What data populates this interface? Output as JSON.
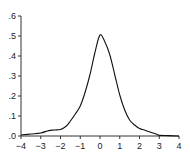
{
  "chart_data": {
    "type": "line",
    "title": "",
    "xlabel": "",
    "ylabel": "",
    "xlim": [
      -4,
      4
    ],
    "ylim": [
      0,
      0.6
    ],
    "grid": false,
    "legend": null,
    "x_ticks": [
      -4,
      -3,
      -2,
      -1,
      0,
      1,
      2,
      3,
      4
    ],
    "x_tick_labels": [
      "−4",
      "−3",
      "−2",
      "−1",
      "0",
      "1",
      "2",
      "3",
      "4"
    ],
    "y_ticks": [
      0,
      0.1,
      0.2,
      0.3,
      0.4,
      0.5,
      0.6
    ],
    "y_tick_labels": [
      ".0",
      ".1",
      ".2",
      ".3",
      ".4",
      ".5",
      ".6"
    ],
    "series": [
      {
        "name": "density",
        "color": "#111111",
        "x": [
          -4.0,
          -3.5,
          -3.0,
          -2.6,
          -2.3,
          -2.0,
          -1.7,
          -1.5,
          -1.25,
          -1.0,
          -0.75,
          -0.5,
          -0.25,
          0.0,
          0.25,
          0.5,
          0.75,
          1.0,
          1.25,
          1.5,
          1.75,
          2.0,
          2.3,
          2.6,
          2.9,
          3.0,
          3.5,
          4.0
        ],
        "values": [
          0.005,
          0.01,
          0.015,
          0.027,
          0.03,
          0.033,
          0.05,
          0.075,
          0.11,
          0.15,
          0.22,
          0.31,
          0.42,
          0.505,
          0.47,
          0.405,
          0.305,
          0.205,
          0.13,
          0.08,
          0.055,
          0.038,
          0.028,
          0.018,
          0.008,
          0.003,
          0.002,
          0.0
        ]
      }
    ]
  }
}
